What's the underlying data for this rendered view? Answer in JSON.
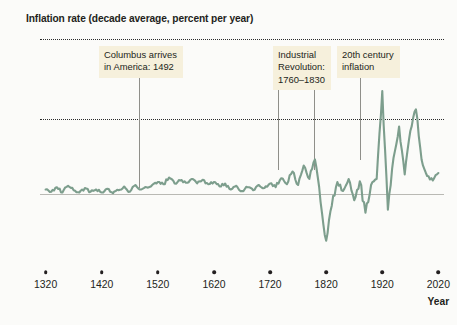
{
  "title": "Inflation rate (decade average, percent per year)",
  "axis": {
    "y_label": "",
    "x_label": "Year",
    "y_ticks": [
      {
        "value": 20,
        "label": "20"
      },
      {
        "value": 10,
        "label": "10"
      },
      {
        "value": 0,
        "label": "0"
      },
      {
        "value": -10,
        "label": "−10"
      }
    ],
    "x_ticks": [
      {
        "value": 1320,
        "label": "1320"
      },
      {
        "value": 1420,
        "label": "1420"
      },
      {
        "value": 1520,
        "label": "1520"
      },
      {
        "value": 1620,
        "label": "1620"
      },
      {
        "value": 1720,
        "label": "1720"
      },
      {
        "value": 1820,
        "label": "1820"
      },
      {
        "value": 1920,
        "label": "1920"
      },
      {
        "value": 2020,
        "label": "2020"
      }
    ]
  },
  "annotations": [
    {
      "name": "columbus",
      "text": "Columbus arrives\nin America: 1492",
      "box_x": 99,
      "box_y": 46,
      "connector_x": 139,
      "connector_top": 75,
      "connector_bottom": 188
    },
    {
      "name": "industrial-revolution",
      "text": "Industrial\nRevolution:\n1760–1830",
      "box_x": 273,
      "box_y": 46,
      "connector_x": 278,
      "connector_top": 88,
      "connector_bottom": 170,
      "connector2_x": 314,
      "connector2_top": 88,
      "connector2_bottom": 170
    },
    {
      "name": "twentieth-century-inflation",
      "text": "20th century\ninflation",
      "box_x": 337,
      "box_y": 46,
      "connector_x": 360,
      "connector_top": 76,
      "connector_bottom": 160
    }
  ],
  "colors": {
    "line": "#7d9e8d",
    "annotation_background": "#f6f0dc",
    "text": "#231f20",
    "grid": "#2b2b2b",
    "zero_line": "#b9b9b4",
    "connector": "#8f8f8a",
    "page_background": "#fbfbf9"
  },
  "chart_data": {
    "type": "line",
    "title": "Inflation rate (decade average, percent per year)",
    "xlabel": "Year",
    "ylabel": "Inflation rate (percent per year)",
    "xlim": [
      1310,
      2030
    ],
    "ylim": [
      -10,
      20
    ],
    "grid": "horizontal dotted at 10 and 20; solid zero line",
    "legend": "none",
    "series_name": "Decade-average inflation rate",
    "x": [
      1320,
      1330,
      1340,
      1350,
      1360,
      1370,
      1380,
      1390,
      1400,
      1410,
      1420,
      1430,
      1440,
      1450,
      1460,
      1470,
      1480,
      1490,
      1500,
      1510,
      1520,
      1530,
      1540,
      1550,
      1560,
      1570,
      1580,
      1590,
      1600,
      1610,
      1620,
      1630,
      1640,
      1650,
      1660,
      1670,
      1680,
      1690,
      1700,
      1710,
      1720,
      1730,
      1740,
      1750,
      1760,
      1770,
      1780,
      1790,
      1800,
      1810,
      1820,
      1830,
      1840,
      1850,
      1860,
      1870,
      1880,
      1890,
      1900,
      1910,
      1920,
      1930,
      1940,
      1950,
      1960,
      1970,
      1980,
      1990,
      2000,
      2010,
      2020
    ],
    "values": [
      0.6,
      0.3,
      0.9,
      0.2,
      1.1,
      0.5,
      0.2,
      0.8,
      0.3,
      0.6,
      0.2,
      0.7,
      0.1,
      0.5,
      1.0,
      0.3,
      1.2,
      0.6,
      0.9,
      1.2,
      1.6,
      1.3,
      2.2,
      1.4,
      1.8,
      1.5,
      2.0,
      1.4,
      1.9,
      1.3,
      1.6,
      1.0,
      1.4,
      0.6,
      1.1,
      0.4,
      0.9,
      0.5,
      1.2,
      0.8,
      1.4,
      0.9,
      2.1,
      1.3,
      3.0,
      1.2,
      3.8,
      2.0,
      4.6,
      -1.0,
      -6.0,
      -1.5,
      1.6,
      0.4,
      2.0,
      -0.8,
      1.7,
      -2.4,
      1.2,
      2.0,
      13.5,
      -2.0,
      4.8,
      9.0,
      2.6,
      8.4,
      11.2,
      4.6,
      2.4,
      1.8,
      2.8
    ],
    "annotations": [
      {
        "label": "Columbus arrives in America: 1492",
        "x": 1492
      },
      {
        "label": "Industrial Revolution: 1760–1830",
        "x_start": 1760,
        "x_end": 1830
      },
      {
        "label": "20th century inflation",
        "x": 1920
      }
    ]
  }
}
